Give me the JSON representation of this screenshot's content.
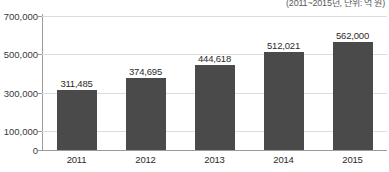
{
  "chart_data": {
    "type": "bar",
    "title": "",
    "subtitle": "(2011~2015년, 단위: 억 원)",
    "categories": [
      "2011",
      "2012",
      "2013",
      "2014",
      "2015"
    ],
    "values": [
      311485,
      374695,
      444618,
      512021,
      562000
    ],
    "value_labels": [
      "311,485",
      "374,695",
      "444,618",
      "512,021",
      "562,000"
    ],
    "xlabel": "",
    "ylabel": "",
    "ylim": [
      0,
      700000
    ],
    "yticks": [
      0,
      100000,
      300000,
      500000,
      700000
    ],
    "ytick_labels": [
      "0",
      "100,000",
      "300,000",
      "500,000",
      "700,000"
    ],
    "grid": true,
    "legend": "none",
    "series": [
      {
        "name": "value",
        "values": [
          311485,
          374695,
          444618,
          512021,
          562000
        ]
      }
    ],
    "colors": {
      "bar": "#4a4a4a",
      "gridline": "#dcdcdc",
      "axis": "#9a9a9a",
      "text": "#2b2b2b",
      "background": "#ffffff"
    }
  }
}
